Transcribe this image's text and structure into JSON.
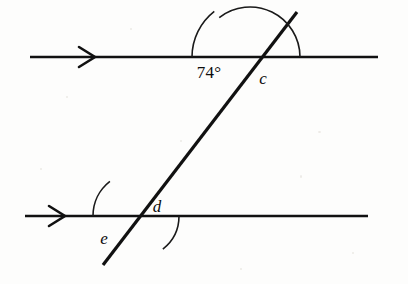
{
  "diagram": {
    "type": "geometry-figure",
    "background_color": "#fdfdfc",
    "stroke_color": "#111111",
    "lines": [
      {
        "name": "top-parallel-line",
        "x1": 30,
        "y1": 57,
        "x2": 378,
        "y2": 57,
        "stroke_width": 2.6,
        "arrow_marker": {
          "x": 95,
          "y": 57,
          "direction": "right"
        }
      },
      {
        "name": "bottom-parallel-line",
        "x1": 25,
        "y1": 216,
        "x2": 368,
        "y2": 216,
        "stroke_width": 2.6,
        "arrow_marker": {
          "x": 65,
          "y": 216,
          "direction": "right"
        }
      },
      {
        "name": "transversal-line",
        "x1": 297,
        "y1": 12,
        "x2": 103,
        "y2": 265,
        "stroke_width": 3.2,
        "arrow_marker": null
      }
    ],
    "intersections": [
      {
        "name": "upper-intersection",
        "x": 250,
        "y": 57
      },
      {
        "name": "lower-intersection",
        "x": 137,
        "y": 216
      }
    ],
    "arcs": [
      {
        "name": "angle-arc-74",
        "center_x": 250,
        "center_y": 57,
        "radius": 58,
        "start_angle_deg": 180,
        "end_angle_deg": 232,
        "stroke_width": 1.6
      },
      {
        "name": "angle-arc-c",
        "center_x": 250,
        "center_y": 57,
        "radius": 50,
        "start_angle_deg": 232,
        "end_angle_deg": 360,
        "stroke_width": 1.6
      },
      {
        "name": "angle-arc-d",
        "center_x": 137,
        "center_y": 216,
        "radius": 42,
        "start_angle_deg": 0,
        "end_angle_deg": 52,
        "stroke_width": 1.6
      },
      {
        "name": "angle-arc-e",
        "center_x": 137,
        "center_y": 216,
        "radius": 44,
        "start_angle_deg": 180,
        "end_angle_deg": 232,
        "stroke_width": 1.6
      }
    ],
    "angles": [
      {
        "id": "angle-74",
        "label": "74°",
        "value": 74,
        "unit": "degrees",
        "known": true,
        "label_x": 209,
        "label_y": 72,
        "position": "upper intersection, left of transversal, below top line"
      },
      {
        "id": "angle-c",
        "label": "c",
        "value": null,
        "unit": "degrees",
        "known": false,
        "label_x": 263,
        "label_y": 78,
        "position": "upper intersection, right of transversal, below top line"
      },
      {
        "id": "angle-d",
        "label": "d",
        "value": null,
        "unit": "degrees",
        "known": false,
        "label_x": 157,
        "label_y": 206,
        "position": "lower intersection, right of transversal, above bottom line"
      },
      {
        "id": "angle-e",
        "label": "e",
        "value": null,
        "unit": "degrees",
        "known": false,
        "label_x": 104,
        "label_y": 238,
        "position": "lower intersection, left of transversal, below bottom line"
      }
    ]
  }
}
